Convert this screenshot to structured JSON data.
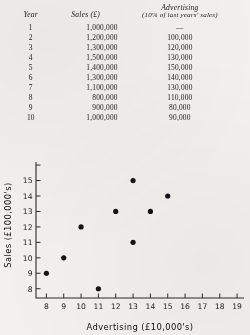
{
  "table": {
    "headers": {
      "year": "Year",
      "sales": "Sales (£)",
      "advertising": "Advertising",
      "advertising_sub": "(10% of last years' sales)"
    },
    "rows": [
      {
        "year": "1",
        "sales": "1,000,000",
        "advertising": "—"
      },
      {
        "year": "2",
        "sales": "1,200,000",
        "advertising": "100,000"
      },
      {
        "year": "3",
        "sales": "1,300,000",
        "advertising": "120,000"
      },
      {
        "year": "4",
        "sales": "1,500,000",
        "advertising": "130,000"
      },
      {
        "year": "5",
        "sales": "1,400,000",
        "advertising": "150,000"
      },
      {
        "year": "6",
        "sales": "1,300,000",
        "advertising": "140,000"
      },
      {
        "year": "7",
        "sales": "1,100,000",
        "advertising": "130,000"
      },
      {
        "year": "8",
        "sales": "800,000",
        "advertising": "110,000"
      },
      {
        "year": "9",
        "sales": "900,000",
        "advertising": "80,000"
      },
      {
        "year": "10",
        "sales": "1,000,000",
        "advertising": "90,000"
      }
    ]
  },
  "chart_data": {
    "type": "scatter",
    "title": "",
    "xlabel": "Advertising (£10,000's)",
    "ylabel": "Sales (£100,000's)",
    "xlim": [
      7.4,
      19.4
    ],
    "ylim": [
      7.4,
      16.2
    ],
    "xticks": [
      8,
      9,
      10,
      11,
      12,
      13,
      14,
      15,
      16,
      17,
      18,
      19
    ],
    "xticklabels": [
      "8",
      "9",
      "10",
      "11",
      "12",
      "13",
      "14",
      "15",
      "16",
      "17",
      "18",
      "19"
    ],
    "yticks": [
      8,
      9,
      10,
      11,
      12,
      13,
      14,
      15,
      16
    ],
    "yticklabels": [
      "8",
      "9",
      "10",
      "11",
      "12",
      "13",
      "14",
      "15",
      ""
    ],
    "grid": false,
    "legend": false,
    "marker": "filled-circle",
    "marker_color": "#141414",
    "points": [
      {
        "x": 8,
        "y": 9
      },
      {
        "x": 9,
        "y": 10
      },
      {
        "x": 10,
        "y": 12
      },
      {
        "x": 11,
        "y": 8
      },
      {
        "x": 12,
        "y": 13
      },
      {
        "x": 13,
        "y": 15
      },
      {
        "x": 13,
        "y": 11
      },
      {
        "x": 14,
        "y": 13
      },
      {
        "x": 15,
        "y": 14
      }
    ]
  },
  "colors": {
    "ink": "#1a1a1a",
    "paper": "#f3f1ed"
  }
}
